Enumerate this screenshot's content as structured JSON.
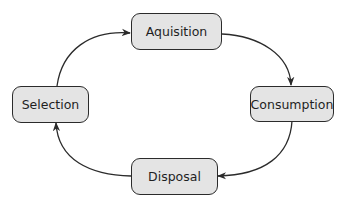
{
  "diagram": {
    "type": "cycle",
    "nodes": [
      {
        "id": "acquisition",
        "label": "Aquisition"
      },
      {
        "id": "consumption",
        "label": "Consumption"
      },
      {
        "id": "disposal",
        "label": "Disposal"
      },
      {
        "id": "selection",
        "label": "Selection"
      }
    ],
    "edges": [
      {
        "from": "selection",
        "to": "acquisition"
      },
      {
        "from": "acquisition",
        "to": "consumption"
      },
      {
        "from": "consumption",
        "to": "disposal"
      },
      {
        "from": "disposal",
        "to": "selection"
      }
    ],
    "colors": {
      "node_fill": "#e4e4e4",
      "node_border": "#2b2b2b",
      "arrow": "#2b2b2b",
      "text": "#1f1f1f"
    }
  }
}
